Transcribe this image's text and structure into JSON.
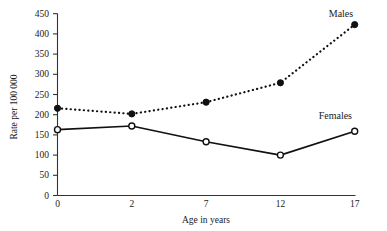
{
  "chart_data": {
    "type": "line",
    "title": "",
    "xlabel": "Age in years",
    "ylabel": "Rate per 100 000",
    "categories": [
      "0",
      "2",
      "7",
      "12",
      "17"
    ],
    "x": [
      0,
      2,
      7,
      12,
      17
    ],
    "xtick_labels": [
      "0",
      "2",
      "7",
      "12",
      "17"
    ],
    "ytick_labels": [
      "0",
      "50",
      "100",
      "150",
      "200",
      "250",
      "300",
      "350",
      "400",
      "450"
    ],
    "yticks": [
      0,
      50,
      100,
      150,
      200,
      250,
      300,
      350,
      400,
      450
    ],
    "ylim": [
      0,
      450
    ],
    "grid": false,
    "legend_position": "inline-right",
    "series": [
      {
        "name": "Males",
        "label": "Males",
        "values": [
          216,
          202,
          231,
          279,
          423
        ],
        "linestyle": "dotted",
        "marker": "filled-circle",
        "color": "#111111"
      },
      {
        "name": "Females",
        "label": "Females",
        "values": [
          163,
          172,
          133,
          100,
          159
        ],
        "linestyle": "solid",
        "marker": "open-circle",
        "color": "#111111"
      }
    ]
  },
  "axes": {
    "y_axis_title": "Rate per 100 000",
    "x_axis_title": "Age in years"
  },
  "labels": {
    "males": "Males",
    "females": "Females"
  }
}
